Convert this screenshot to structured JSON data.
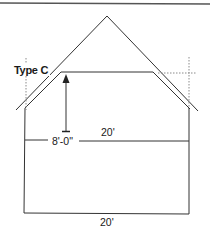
{
  "diagram": {
    "title_label": "Type C",
    "ceiling_height_label": "8'-0\"",
    "attic_width_label": "20'",
    "floor_width_label": "20'",
    "colors": {
      "line": "#333333",
      "dotted": "#8a8a8a",
      "rule": "#555555"
    }
  }
}
